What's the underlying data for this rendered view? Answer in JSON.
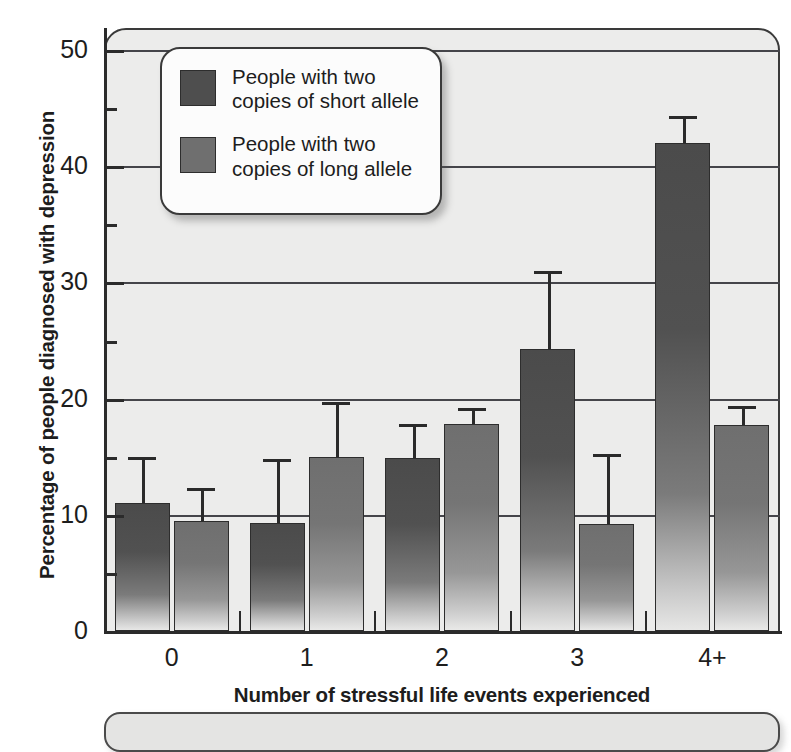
{
  "chart_data": {
    "type": "bar",
    "title": "",
    "xlabel": "Number of stressful life events experienced",
    "ylabel": "Percentage of people diagnosed with depression",
    "categories": [
      "0",
      "1",
      "2",
      "3",
      "4+"
    ],
    "ylim": [
      0,
      50
    ],
    "ytick_labels": [
      "0",
      "10",
      "20",
      "30",
      "40",
      "50"
    ],
    "ytick_values": [
      0,
      10,
      20,
      30,
      40,
      50
    ],
    "yminor_values": [
      5,
      15,
      25,
      35,
      45
    ],
    "grid": "horizontal-major",
    "legend_position": "upper-left-inside",
    "series": [
      {
        "name": "People with two\ncopies of short allele",
        "key": "short",
        "color": "#4e4e4e",
        "values": [
          11.0,
          9.3,
          14.9,
          24.3,
          42.0
        ],
        "err_upper": [
          15.0,
          14.8,
          17.8,
          31.0,
          44.3
        ]
      },
      {
        "name": "People with two\ncopies of long allele",
        "key": "long",
        "color": "#6f6f6f",
        "values": [
          9.5,
          15.0,
          17.8,
          9.2,
          17.7
        ],
        "err_upper": [
          12.3,
          19.7,
          19.2,
          15.2,
          19.4
        ]
      }
    ]
  },
  "legend": {
    "items": [
      {
        "label": "People with two\ncopies of short allele",
        "swatch": "short"
      },
      {
        "label": "People with two\ncopies of long allele",
        "swatch": "long"
      }
    ]
  },
  "axes": {
    "y_title": "Percentage of people diagnosed with depression",
    "x_title": "Number of stressful life events experienced",
    "y_labels": [
      "50",
      "40",
      "30",
      "20",
      "10",
      "0"
    ],
    "x_labels": [
      "0",
      "1",
      "2",
      "3",
      "4+"
    ]
  },
  "colors": {
    "panel_background": "#ececeb",
    "axis": "#2b2b2b",
    "gridline": "#45454a",
    "short_allele": "#4e4e4e",
    "long_allele": "#6f6f6f",
    "legend_background": "#fcfcfc",
    "text": "#1d1d1d"
  }
}
